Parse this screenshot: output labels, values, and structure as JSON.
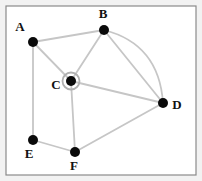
{
  "figure": {
    "width": 202,
    "height": 181,
    "background_color": "#f2f2f2",
    "plot_background_color": "#ffffff",
    "frame": {
      "x": 6,
      "y": 6,
      "width": 190,
      "height": 169,
      "color": "#8a8a8a",
      "stroke_width": 1.2
    }
  },
  "style": {
    "node_color": "#0a0a0a",
    "node_radius": 5,
    "edge_color": "#c6c6c6",
    "edge_width": 1.8,
    "highlight_ring_color": "#b0b0b0",
    "highlight_ring_radius": 8.5,
    "highlight_ring_width": 1.8,
    "label_color": "#111111",
    "label_font_size": 13
  },
  "graph_data": {
    "type": "graph",
    "directed": false,
    "multigraph": true,
    "node_count": 6,
    "edge_count": 10,
    "highlighted_node": "C",
    "nodes": [
      {
        "id": "A",
        "label": "A",
        "x": 33,
        "y": 42,
        "label_x": 20,
        "label_y": 31,
        "highlighted": false
      },
      {
        "id": "B",
        "label": "B",
        "x": 104,
        "y": 30,
        "label_x": 103,
        "label_y": 18,
        "highlighted": false
      },
      {
        "id": "C",
        "label": "C",
        "x": 71,
        "y": 81,
        "label_x": 56,
        "label_y": 89,
        "highlighted": true
      },
      {
        "id": "D",
        "label": "D",
        "x": 163,
        "y": 103,
        "label_x": 177,
        "label_y": 109,
        "highlighted": false
      },
      {
        "id": "E",
        "label": "E",
        "x": 33,
        "y": 140,
        "label_x": 29,
        "label_y": 158,
        "highlighted": false
      },
      {
        "id": "F",
        "label": "F",
        "x": 75,
        "y": 152,
        "label_x": 74,
        "label_y": 170,
        "highlighted": false
      }
    ],
    "edges": [
      {
        "source": "A",
        "target": "B",
        "curved": false
      },
      {
        "source": "A",
        "target": "C",
        "curved": false
      },
      {
        "source": "A",
        "target": "E",
        "curved": false
      },
      {
        "source": "B",
        "target": "C",
        "curved": false
      },
      {
        "source": "B",
        "target": "D",
        "curved": false
      },
      {
        "source": "B",
        "target": "D",
        "curved": true,
        "control_x": 159,
        "control_y": 44
      },
      {
        "source": "C",
        "target": "D",
        "curved": false
      },
      {
        "source": "C",
        "target": "F",
        "curved": false
      },
      {
        "source": "E",
        "target": "F",
        "curved": false
      },
      {
        "source": "F",
        "target": "D",
        "curved": false
      }
    ]
  }
}
